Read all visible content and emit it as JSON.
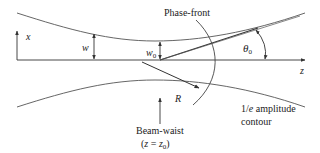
{
  "diagram": {
    "colors": {
      "line": "#333333",
      "envelope": "#555555",
      "text": "#222222",
      "background": "#ffffff"
    },
    "labels": {
      "x_axis": "x",
      "z_axis": "z",
      "w": "w",
      "w0_main": "w",
      "w0_sub": "0",
      "theta_main": "θ",
      "theta_sub": "0",
      "phase_front": "Phase-front",
      "R": "R",
      "beam_waist_line1": "Beam-waist",
      "beam_waist_line2_open": "(",
      "beam_waist_line2_z": "z",
      "beam_waist_line2_eq": " = ",
      "beam_waist_line2_z0": "z",
      "beam_waist_line2_sub": "0",
      "beam_waist_line2_close": ")",
      "contour_line1_a": "1/",
      "contour_line1_e": "e",
      "contour_line1_b": " amplitude",
      "contour_line2": "contour"
    },
    "elements": [
      "z-axis (optical axis)",
      "x-axis arrow",
      "upper 1/e amplitude envelope",
      "lower 1/e amplitude envelope",
      "beam radius w arrow",
      "waist radius w0 arrow",
      "divergence asymptote",
      "divergence angle theta0 arc",
      "phase-front arc",
      "radius of curvature R arrow",
      "beam-waist pointer arrow"
    ]
  }
}
